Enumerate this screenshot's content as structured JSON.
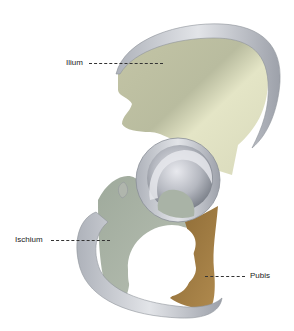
{
  "figure": {
    "colors": {
      "background": "#ffffff",
      "ilium": "#cfd0b4",
      "ilium_light": "#e6e6c8",
      "ischium": "#a8b3a5",
      "pubis": "#9b7a42",
      "cartilage_rim": "#c9ccd2",
      "rim_shadow": "#8a8f98",
      "acetabulum": "#9ea2ab"
    },
    "labels": [
      {
        "id": "ilium",
        "text": "Ilium"
      },
      {
        "id": "ischium",
        "text": "Ischium"
      },
      {
        "id": "pubis",
        "text": "Pubis"
      }
    ]
  }
}
